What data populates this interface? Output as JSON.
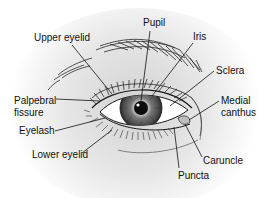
{
  "diagram": {
    "colors": {
      "background_center": "#d4d4d4",
      "background_edge": "#ffffff",
      "ink": "#1a1a1a",
      "iris": "#5a5a5a",
      "iris_dark": "#2e2e2e",
      "pupil": "#0c0c0c",
      "sclera": "#ffffff",
      "label_text": "#111111"
    },
    "labels": [
      {
        "id": "pupil",
        "text": "Pupil",
        "x": 143,
        "y": 18,
        "target": [
          141,
          101
        ],
        "line_from": [
          150,
          31
        ]
      },
      {
        "id": "upper-eyelid",
        "text": "Upper eyelid",
        "x": 34,
        "y": 33,
        "target": [
          112,
          94
        ],
        "line_from": [
          72,
          45
        ]
      },
      {
        "id": "iris",
        "text": "Iris",
        "x": 193,
        "y": 32,
        "target": [
          152,
          96
        ],
        "line_from": [
          193,
          43
        ]
      },
      {
        "id": "sclera",
        "text": "Sclera",
        "x": 216,
        "y": 66,
        "target": [
          170,
          106
        ],
        "line_from": [
          214,
          71
        ]
      },
      {
        "id": "palpebral-fissure",
        "text": "Palpebral\nfissure",
        "x": 14,
        "y": 95,
        "target": [
          100,
          101
        ],
        "line_from": [
          56,
          99
        ]
      },
      {
        "id": "medial-canthus",
        "text": "Medial\ncanthus",
        "x": 221,
        "y": 95,
        "target": [
          189,
          120
        ],
        "line_from": [
          219,
          101
        ]
      },
      {
        "id": "eyelash",
        "text": "Eyelash",
        "x": 19,
        "y": 126,
        "target": [
          105,
          118
        ],
        "line_from": [
          55,
          131
        ]
      },
      {
        "id": "lower-eyelid",
        "text": "Lower eyelid",
        "x": 32,
        "y": 150,
        "target": [
          112,
          130
        ],
        "line_from": [
          82,
          153
        ]
      },
      {
        "id": "caruncle",
        "text": "Caruncle",
        "x": 203,
        "y": 156,
        "target": [
          185,
          124
        ],
        "line_from": [
          202,
          157
        ]
      },
      {
        "id": "puncta",
        "text": "Puncta",
        "x": 178,
        "y": 171,
        "target": [
          174,
          127
        ],
        "line_from": [
          179,
          168
        ]
      }
    ]
  }
}
